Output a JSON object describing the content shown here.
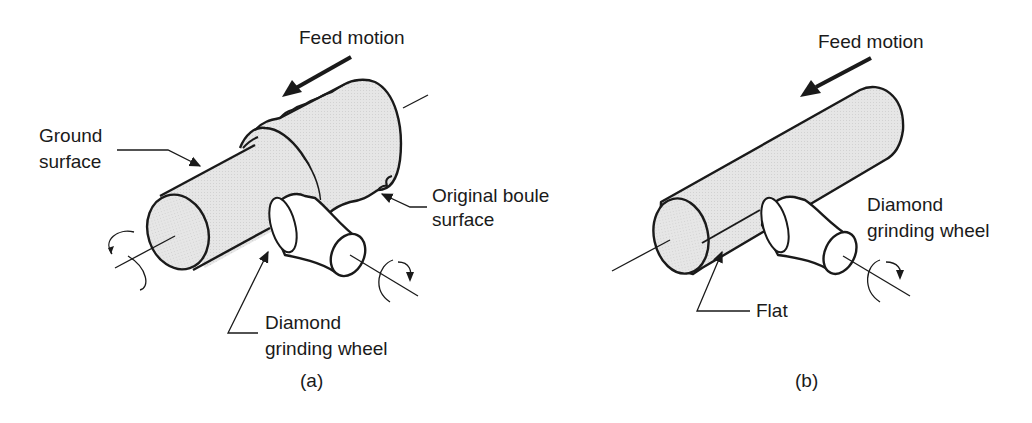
{
  "figure": {
    "panels": [
      {
        "id": "a",
        "caption": "(a)",
        "labels": {
          "feed_motion": "Feed motion",
          "ground_surface_l1": "Ground",
          "ground_surface_l2": "surface",
          "original_boule_l1": "Original boule",
          "original_boule_l2": "surface",
          "wheel_l1": "Diamond",
          "wheel_l2": "grinding wheel"
        }
      },
      {
        "id": "b",
        "caption": "(b)",
        "labels": {
          "feed_motion": "Feed motion",
          "wheel_l1": "Diamond",
          "wheel_l2": "grinding wheel",
          "flat": "Flat"
        }
      }
    ],
    "colors": {
      "fill": "#e4e4e4",
      "stroke": "#1a1a1a",
      "background": "#ffffff"
    }
  }
}
